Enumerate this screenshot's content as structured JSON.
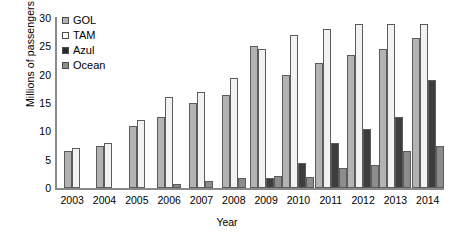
{
  "chart_data": {
    "type": "bar",
    "title": "",
    "xlabel": "Year",
    "ylabel": "Millions of passengers",
    "categories": [
      "2003",
      "2004",
      "2005",
      "2006",
      "2007",
      "2008",
      "2009",
      "2010",
      "2011",
      "2012",
      "2013",
      "2014"
    ],
    "ylim": [
      0,
      30
    ],
    "yticks": [
      0,
      5,
      10,
      15,
      20,
      25,
      30
    ],
    "grid": false,
    "legend_position": "top-left",
    "series": [
      {
        "name": "GOL",
        "color": "#b3b3b3",
        "values": [
          6.5,
          7.5,
          11,
          12.5,
          15,
          16.5,
          25,
          20,
          22,
          23.5,
          24.5,
          26.5
        ]
      },
      {
        "name": "TAM",
        "color": "#f2f2f2",
        "values": [
          7,
          8,
          12,
          16,
          17,
          19.5,
          24.5,
          27,
          28,
          29,
          29,
          29
        ]
      },
      {
        "name": "Azul",
        "color": "#3d3d3d",
        "values": [
          0,
          0,
          0,
          0,
          0,
          0,
          1.8,
          4.5,
          8,
          10.5,
          12.5,
          19
        ]
      },
      {
        "name": "Ocean",
        "color": "#8c8c8c",
        "values": [
          0,
          0,
          0,
          0.7,
          1.3,
          1.7,
          2.2,
          2,
          3.5,
          4,
          6.5,
          7.5
        ]
      }
    ]
  }
}
